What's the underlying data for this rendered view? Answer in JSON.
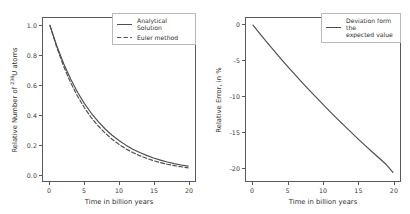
{
  "figure": {
    "background": "#ffffff",
    "line_color": "#4d4d4d",
    "axis_color": "#5a5a5a"
  },
  "chart_data": [
    {
      "type": "line",
      "panel": "left",
      "title": "",
      "xlabel": "Time in billion years",
      "ylabel_text": "Relative Number of ",
      "ylabel_isotope_mass": "238",
      "ylabel_isotope_symbol": "U",
      "ylabel_suffix": " atoms",
      "xlim": [
        -1.0,
        21.0
      ],
      "ylim": [
        -0.05,
        1.05
      ],
      "xticks": [
        0,
        5,
        10,
        15,
        20
      ],
      "xticklabels": [
        "0",
        "5",
        "10",
        "15",
        "20"
      ],
      "yticks": [
        0.0,
        0.2,
        0.4,
        0.6,
        0.8,
        1.0
      ],
      "yticklabels": [
        "0.0",
        "0.2",
        "0.4",
        "0.6",
        "0.8",
        "1.0"
      ],
      "grid": false,
      "legend_position": "upper right",
      "x": [
        0,
        1,
        2,
        3,
        4,
        5,
        6,
        7,
        8,
        9,
        10,
        11,
        12,
        13,
        14,
        15,
        16,
        17,
        18,
        19,
        20
      ],
      "series": [
        {
          "name": "Analytical Solution",
          "linestyle": "solid",
          "color": "#4d4d4d",
          "values": [
            1.0,
            0.861,
            0.741,
            0.638,
            0.549,
            0.472,
            0.407,
            0.35,
            0.301,
            0.259,
            0.223,
            0.192,
            0.165,
            0.142,
            0.123,
            0.105,
            0.091,
            0.078,
            0.067,
            0.058,
            0.05
          ]
        },
        {
          "name": "Euler method",
          "linestyle": "dashed",
          "color": "#4d4d4d",
          "values": [
            1.0,
            0.85,
            0.723,
            0.614,
            0.522,
            0.444,
            0.377,
            0.321,
            0.273,
            0.232,
            0.197,
            0.167,
            0.142,
            0.121,
            0.103,
            0.087,
            0.074,
            0.063,
            0.054,
            0.046,
            0.039
          ]
        }
      ]
    },
    {
      "type": "line",
      "panel": "right",
      "title": "",
      "xlabel": "Time in billion years",
      "ylabel": "Relative Error, in %",
      "xlim": [
        -1.0,
        21.0
      ],
      "ylim": [
        -22.0,
        1.0
      ],
      "xticks": [
        0,
        5,
        10,
        15,
        20
      ],
      "xticklabels": [
        "0",
        "5",
        "10",
        "15",
        "20"
      ],
      "yticks": [
        0,
        -5,
        -10,
        -15,
        -20
      ],
      "yticklabels": [
        "0",
        "-5",
        "-10",
        "-15",
        "-20"
      ],
      "grid": false,
      "legend_position": "upper right",
      "x": [
        0,
        1,
        2,
        3,
        4,
        5,
        6,
        7,
        8,
        9,
        10,
        11,
        12,
        13,
        14,
        15,
        16,
        17,
        18,
        19,
        20
      ],
      "series": [
        {
          "name": "Deviation form the\nexpected value",
          "linestyle": "solid",
          "color": "#4d4d4d",
          "values": [
            0.0,
            -1.25,
            -2.45,
            -3.62,
            -4.77,
            -5.9,
            -7.0,
            -8.08,
            -9.14,
            -10.18,
            -11.2,
            -12.2,
            -13.19,
            -14.16,
            -15.11,
            -16.05,
            -16.97,
            -17.87,
            -18.76,
            -19.64,
            -20.8
          ]
        }
      ]
    }
  ],
  "left_panel": {
    "legend": [
      {
        "label": "Analytical Solution",
        "style": "solid"
      },
      {
        "label": "Euler method",
        "style": "dashed"
      }
    ]
  },
  "right_panel": {
    "legend": [
      {
        "label": "Deviation form the\nexpected value",
        "style": "solid"
      }
    ]
  }
}
